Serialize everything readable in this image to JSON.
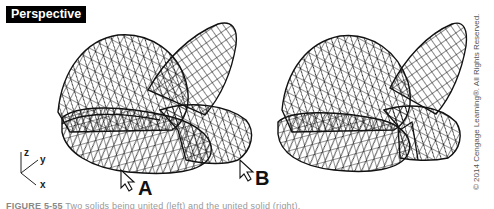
{
  "viewport": {
    "label": "Perspective"
  },
  "axes": {
    "z": "z",
    "y": "y",
    "x": "x"
  },
  "markers": {
    "left": "A",
    "right": "B"
  },
  "copyright": "© 2014 Cengage Learning®. All Rights Reserved.",
  "caption": {
    "figure": "FIGURE 5-55",
    "text": "Two solids being united (left) and the united solid (right)."
  },
  "colors": {
    "wire": "#111111",
    "label_bg": "#000000",
    "label_fg": "#ffffff"
  }
}
